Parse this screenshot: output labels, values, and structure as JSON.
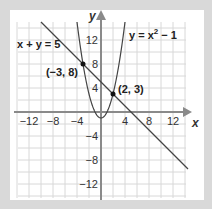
{
  "chart_data": {
    "type": "line",
    "title": "",
    "xlabel": "x",
    "ylabel": "y",
    "xlim": [
      -14,
      14
    ],
    "ylim": [
      -14,
      15
    ],
    "grid": true,
    "grid_step": 2,
    "x_ticks": [
      -12,
      -8,
      -4,
      4,
      8,
      12
    ],
    "y_ticks": [
      12,
      8,
      4,
      -4,
      -8,
      -12
    ],
    "x_tick_labels": [
      "−12",
      "−8",
      "−4",
      "4",
      "8",
      "12"
    ],
    "y_tick_labels": [
      "12",
      "8",
      "4",
      "−4",
      "−8",
      "−12"
    ],
    "series": [
      {
        "name": "x + y = 5",
        "kind": "line",
        "equation": "y = 5 - x",
        "x_range": [
          -10,
          14.5
        ]
      },
      {
        "name": "y = x² − 1",
        "kind": "parabola",
        "equation": "y = x^2 - 1",
        "x_range": [
          -4,
          4
        ]
      }
    ],
    "points": [
      {
        "label": "(−3, 8)",
        "x": -3,
        "y": 8
      },
      {
        "label": "(2, 3)",
        "x": 2,
        "y": 3
      }
    ],
    "annotations": {
      "line_label": "x + y = 5",
      "parabola_label_main": "y = x",
      "parabola_label_sup": "2",
      "parabola_label_tail": " − 1"
    },
    "colors": {
      "background": "#d9d9d9",
      "panel": "#ffffff",
      "grid": "#d8d8d8",
      "axis": "#8a8a8a",
      "curve": "#444444",
      "point": "#111111"
    }
  }
}
